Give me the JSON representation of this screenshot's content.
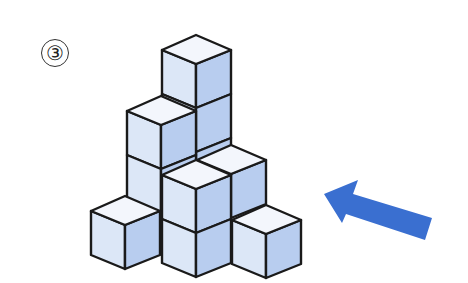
{
  "problem": {
    "number_label": "③"
  },
  "figure": {
    "colors": {
      "top_face": "#f3f6fc",
      "left_face": "#dce7f7",
      "right_face": "#b8cdef",
      "edge": "#1a1a1a",
      "arrow": "#3a6fd0"
    },
    "cube": {
      "dx_left": -34,
      "dx_right": 35,
      "dy_side": 15,
      "dy_front": 29,
      "height": 44
    },
    "cubes": [
      {
        "id": "A",
        "tx": 196,
        "ty": 35,
        "show_top": true
      },
      {
        "id": "B",
        "tx": 196,
        "ty": 79,
        "show_top": false
      },
      {
        "id": "E",
        "tx": 196,
        "ty": 123,
        "show_top": false
      },
      {
        "id": "D",
        "tx": 231,
        "ty": 145,
        "show_top": true
      },
      {
        "id": "C",
        "tx": 161,
        "ty": 96,
        "show_top": true
      },
      {
        "id": "F",
        "tx": 161,
        "ty": 140,
        "show_top": false
      },
      {
        "id": "G",
        "tx": 196,
        "ty": 160,
        "show_top": true
      },
      {
        "id": "H",
        "tx": 125,
        "ty": 196,
        "show_top": true
      },
      {
        "id": "I",
        "tx": 196,
        "ty": 204,
        "show_top": false
      },
      {
        "id": "J",
        "tx": 266,
        "ty": 205,
        "show_top": true
      }
    ],
    "arrow": {
      "points": [
        [
          324,
          194
        ],
        [
          358,
          180
        ],
        [
          353,
          194
        ],
        [
          432,
          218
        ],
        [
          425,
          240
        ],
        [
          346,
          214
        ],
        [
          342,
          223
        ]
      ],
      "direction": "pointing up-left toward the cube stack"
    }
  }
}
